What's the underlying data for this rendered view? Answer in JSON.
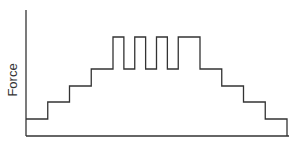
{
  "chart_data": {
    "type": "line",
    "subtype": "step",
    "title": "",
    "xlabel": "",
    "ylabel": "Force",
    "grid": false,
    "legend": null,
    "axis_ticks": false,
    "x_segments": [
      0,
      1,
      2,
      3,
      4,
      4.5,
      5,
      5.5,
      6,
      6.5,
      7,
      8,
      9,
      10,
      11,
      12
    ],
    "levels": [
      1,
      2,
      3,
      4,
      6,
      4,
      6,
      4,
      6,
      4,
      6,
      4,
      3,
      2,
      1
    ],
    "ylim": [
      0,
      7
    ],
    "xlim": [
      0,
      12.5
    ],
    "line_color": "#333333"
  },
  "axes": {
    "ylabel": "Force"
  }
}
